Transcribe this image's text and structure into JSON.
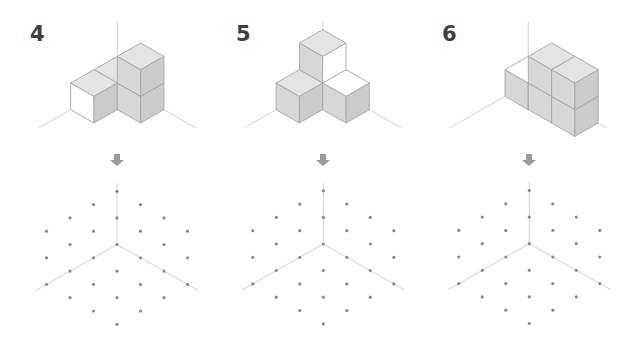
{
  "iso": {
    "dx": 23.3,
    "dy": 13.33,
    "dz": 26.67
  },
  "colors": {
    "top": "#e4e4e4",
    "left": "#d7d7d7",
    "right": "#cbcbcb",
    "white": "#ffffff",
    "edge": "#a6a6a6",
    "axis": "#d2d2d2",
    "dot": "#8a8a8a",
    "arrow": "#9a9a9a",
    "label": "#3f3f3f"
  },
  "panels": [
    {
      "label": "4",
      "label_pos": [
        30,
        22
      ],
      "origin": [
        117.3,
        83
      ],
      "axis_top_y": 22,
      "axis_len": 3.35,
      "cubes": [
        {
          "i": 0,
          "j": 0,
          "k": 0
        },
        {
          "i": 1,
          "j": 0,
          "k": 0,
          "left": "white"
        },
        {
          "i": 0,
          "j": 1,
          "k": 0
        },
        {
          "i": 0,
          "j": 1,
          "k": 1
        }
      ],
      "arrow_center": [
        117,
        160
      ],
      "grid_center": [
        117,
        244.5
      ]
    },
    {
      "label": "5",
      "label_pos": [
        236,
        22
      ],
      "origin": [
        322.7,
        83
      ],
      "axis_top_y": 22,
      "axis_len": 3.35,
      "cubes": [
        {
          "i": 1,
          "j": 0,
          "k": 0
        },
        {
          "i": 0,
          "j": 1,
          "k": 0,
          "top": "white"
        },
        {
          "i": 0,
          "j": 0,
          "k": 1,
          "right": "white"
        }
      ],
      "arrow_center": [
        323,
        160
      ],
      "grid_center": [
        323.3,
        244
      ]
    },
    {
      "label": "6",
      "label_pos": [
        442,
        22
      ],
      "origin": [
        528.3,
        83
      ],
      "axis_top_y": 22,
      "axis_len": 3.35,
      "cubes": [
        {
          "i": 0,
          "j": 0,
          "k": 0,
          "top": "white"
        },
        {
          "i": 0,
          "j": 1,
          "k": 0
        },
        {
          "i": 0,
          "j": 2,
          "k": 0
        },
        {
          "i": 0,
          "j": 1,
          "k": 1
        },
        {
          "i": 0,
          "j": 2,
          "k": 1
        }
      ],
      "arrow_center": [
        529,
        160
      ],
      "grid_center": [
        529.3,
        243.7
      ]
    }
  ],
  "dot_grid": {
    "step_x": 23.5,
    "step_y": 13.3,
    "axis_up": 4.6,
    "axis_diag": 3.45,
    "dots": [
      [
        0,
        -4
      ],
      [
        -1,
        -3
      ],
      [
        1,
        -3
      ],
      [
        -2,
        -2
      ],
      [
        0,
        -2
      ],
      [
        2,
        -2
      ],
      [
        -3,
        -1
      ],
      [
        -1,
        -1
      ],
      [
        1,
        -1
      ],
      [
        3,
        -1
      ],
      [
        -2,
        0
      ],
      [
        0,
        0
      ],
      [
        2,
        0
      ],
      [
        -3,
        1
      ],
      [
        -1,
        1
      ],
      [
        1,
        1
      ],
      [
        3,
        1
      ],
      [
        -2,
        2
      ],
      [
        0,
        2
      ],
      [
        2,
        2
      ],
      [
        -3,
        3
      ],
      [
        -1,
        3
      ],
      [
        1,
        3
      ],
      [
        3,
        3
      ],
      [
        -2,
        4
      ],
      [
        0,
        4
      ],
      [
        2,
        4
      ],
      [
        -1,
        5
      ],
      [
        1,
        5
      ],
      [
        0,
        6
      ]
    ]
  }
}
